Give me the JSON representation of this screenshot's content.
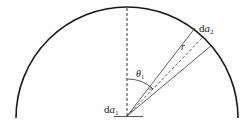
{
  "diagram": {
    "type": "hemisphere-view-factor",
    "labels": {
      "da2": "da",
      "da2_var": "a",
      "da2_sub": "2",
      "da2_prefix": "d",
      "da1_prefix": "d",
      "da1_var": "a",
      "da1_sub": "1",
      "r": "r",
      "theta_var": "θ",
      "theta_sub": "1"
    },
    "colors": {
      "stroke": "#1a1a1a",
      "thin_stroke": "#333333"
    }
  }
}
